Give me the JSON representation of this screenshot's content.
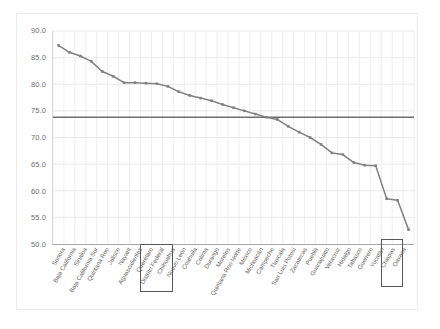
{
  "chart_data": {
    "type": "line",
    "title": "",
    "subtitle": "",
    "xlabel": "",
    "ylabel": "",
    "ylim": [
      50.0,
      90.0
    ],
    "ytick_step": 5.0,
    "yticks": [
      "90.0",
      "85.0",
      "80.0",
      "75.0",
      "70.0",
      "65.0",
      "60.0",
      "55.0",
      "50.0"
    ],
    "grid": true,
    "grid_orientation": "both",
    "legend": "none",
    "marker": "square",
    "series_color": "#808285",
    "reference_line": {
      "label": "national average",
      "value": 73.8,
      "color": "#6d6e71"
    },
    "categories": [
      "Sonora",
      "Baja California",
      "Sinaloa",
      "Baja California Sur",
      "Quintana Roo",
      "Jalisco",
      "Nayarit",
      "Aguascalientes",
      "Querétaro",
      "Distrito Federal",
      "Chihuahua",
      "Nuevo León",
      "Coahuila",
      "Colima",
      "Durango",
      "Morelos",
      "Quintana Roo Norte",
      "México",
      "Michoacán",
      "Campeche",
      "Tlaxcala",
      "San Luis Potosí",
      "Zacatecas",
      "Puebla",
      "Guanajuato",
      "Veracruz",
      "Hidalgo",
      "Tabasco",
      "Guerrero",
      "Yucatán",
      "Chiapas",
      "Oaxaca"
    ],
    "values": [
      87.3,
      86.0,
      85.3,
      84.3,
      82.4,
      81.5,
      80.3,
      80.3,
      80.2,
      80.1,
      79.6,
      78.6,
      77.9,
      77.4,
      76.9,
      76.2,
      75.6,
      75.0,
      74.4,
      73.8,
      73.4,
      72.1,
      71.0,
      70.0,
      68.7,
      67.1,
      66.8,
      65.3,
      64.8,
      64.7,
      58.5,
      58.2
    ],
    "highlighted_categories": [
      "Distrito Federal",
      "Chiapas",
      "Oaxaca"
    ],
    "final_value": 52.7
  }
}
